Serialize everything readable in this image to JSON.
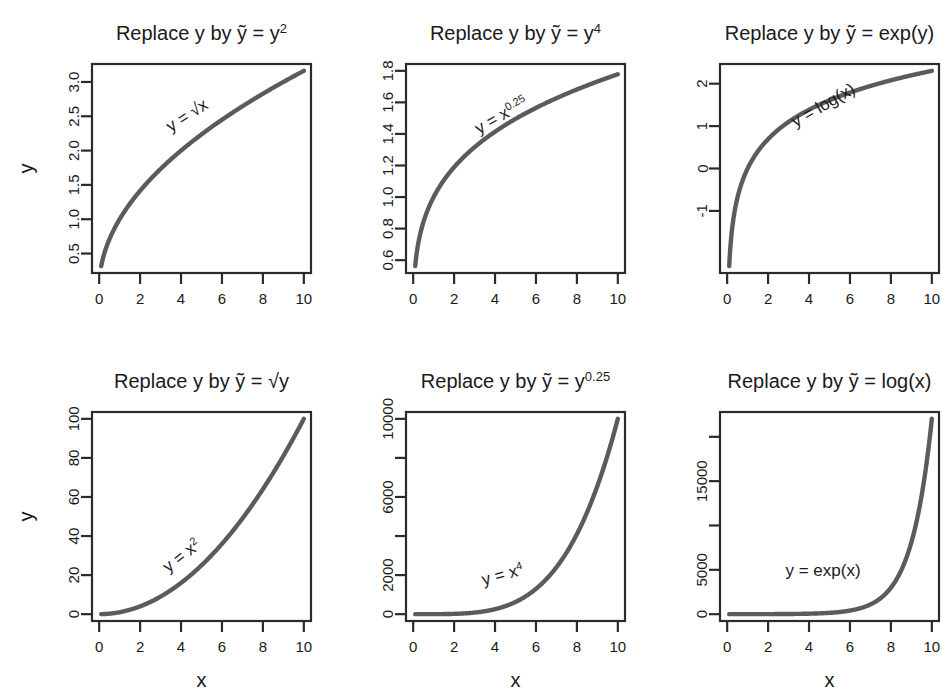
{
  "figure": {
    "width": 942,
    "height": 695,
    "background": "#ffffff",
    "curve_color": "#5b5b5b",
    "axis_color": "#2b2b2b",
    "text_color": "#1a1a1a",
    "layout": "2 rows x 3 columns of R base-graphics panels"
  },
  "chart_data": [
    {
      "id": "panel-1",
      "type": "line",
      "position": "row1-col1",
      "title": "Replace y by ỹ = y2",
      "title_parts": {
        "lead": "Replace y by ",
        "ytilde": "ỹ",
        "eq": " = y",
        "sup": "2"
      },
      "xlabel": "",
      "ylabel": "y",
      "annotation": "y = √x",
      "annotation_rotation_deg": -33,
      "function": "y = sqrt(x)",
      "xlim": [
        0.1,
        10
      ],
      "ylim": [
        0.316,
        3.162
      ],
      "xticks": [
        0,
        2,
        4,
        6,
        8,
        10
      ],
      "xticklabels": [
        "0",
        "2",
        "4",
        "6",
        "8",
        "10"
      ],
      "yticks": [
        0.5,
        1.0,
        1.5,
        2.0,
        2.5,
        3.0
      ],
      "yticklabels": [
        "0.5",
        "1.0",
        "1.5",
        "2.0",
        "2.5",
        "3.0"
      ],
      "grid": false,
      "x": [
        0.1,
        0.5,
        1,
        2,
        3,
        4,
        5,
        6,
        7,
        8,
        9,
        10
      ],
      "y": [
        0.316,
        0.707,
        1.0,
        1.414,
        1.732,
        2.0,
        2.236,
        2.449,
        2.646,
        2.828,
        3.0,
        3.162
      ]
    },
    {
      "id": "panel-2",
      "type": "line",
      "position": "row1-col2",
      "title": "Replace y by ỹ = y4",
      "title_parts": {
        "lead": "Replace y by ",
        "ytilde": "ỹ",
        "eq": " = y",
        "sup": "4"
      },
      "xlabel": "",
      "ylabel": "",
      "annotation": "y = x0.25",
      "annotation_rotation_deg": -30,
      "function": "y = x^0.25",
      "xlim": [
        0.1,
        10
      ],
      "ylim": [
        0.562,
        1.778
      ],
      "xticks": [
        0,
        2,
        4,
        6,
        8,
        10
      ],
      "xticklabels": [
        "0",
        "2",
        "4",
        "6",
        "8",
        "10"
      ],
      "yticks": [
        0.6,
        0.8,
        1.0,
        1.2,
        1.4,
        1.6,
        1.8
      ],
      "yticklabels": [
        "0.6",
        "0.8",
        "1.0",
        "1.2",
        "1.4",
        "1.6",
        "1.8"
      ],
      "grid": false,
      "x": [
        0.1,
        0.5,
        1,
        2,
        3,
        4,
        5,
        6,
        7,
        8,
        9,
        10
      ],
      "y": [
        0.562,
        0.841,
        1.0,
        1.189,
        1.316,
        1.414,
        1.495,
        1.565,
        1.627,
        1.682,
        1.732,
        1.778
      ]
    },
    {
      "id": "panel-3",
      "type": "line",
      "position": "row1-col3",
      "title": "Replace y by ỹ = exp(y)",
      "title_parts": {
        "lead": "Replace y by ",
        "ytilde": "ỹ",
        "eq": " = exp(y)",
        "sup": ""
      },
      "xlabel": "",
      "ylabel": "",
      "annotation": "y = log(x)",
      "annotation_rotation_deg": -30,
      "function": "y = log(x)",
      "xlim": [
        0.1,
        10
      ],
      "ylim": [
        -2.303,
        2.303
      ],
      "xticks": [
        0,
        2,
        4,
        6,
        8,
        10
      ],
      "xticklabels": [
        "0",
        "2",
        "4",
        "6",
        "8",
        "10"
      ],
      "yticks": [
        -1,
        0,
        1,
        2
      ],
      "yticklabels": [
        "-1",
        "0",
        "1",
        "2"
      ],
      "grid": false,
      "x": [
        0.1,
        0.5,
        1,
        2,
        3,
        4,
        5,
        6,
        7,
        8,
        9,
        10
      ],
      "y": [
        -2.303,
        -0.693,
        0.0,
        0.693,
        1.099,
        1.386,
        1.609,
        1.792,
        1.946,
        2.079,
        2.197,
        2.303
      ]
    },
    {
      "id": "panel-4",
      "type": "line",
      "position": "row2-col1",
      "title": "Replace y by ỹ = √y",
      "title_parts": {
        "lead": "Replace y by ",
        "ytilde": "ỹ",
        "eq": " = √y",
        "sup": ""
      },
      "xlabel": "x",
      "ylabel": "y",
      "annotation": "y = x2",
      "annotation_rotation_deg": -38,
      "function": "y = x^2",
      "xlim": [
        0.1,
        10
      ],
      "ylim": [
        0,
        100
      ],
      "xticks": [
        0,
        2,
        4,
        6,
        8,
        10
      ],
      "xticklabels": [
        "0",
        "2",
        "4",
        "6",
        "8",
        "10"
      ],
      "yticks": [
        0,
        20,
        40,
        60,
        80,
        100
      ],
      "yticklabels": [
        "0",
        "20",
        "40",
        "60",
        "80",
        "100"
      ],
      "grid": false,
      "x": [
        0.1,
        1,
        2,
        3,
        4,
        5,
        6,
        7,
        8,
        9,
        10
      ],
      "y": [
        0.01,
        1,
        4,
        9,
        16,
        25,
        36,
        49,
        64,
        81,
        100
      ]
    },
    {
      "id": "panel-5",
      "type": "line",
      "position": "row2-col2",
      "title": "Replace y by ỹ = y0.25",
      "title_parts": {
        "lead": "Replace y by ",
        "ytilde": "ỹ",
        "eq": " = y",
        "sup": "0.25"
      },
      "xlabel": "x",
      "ylabel": "",
      "annotation": "y = x4",
      "annotation_rotation_deg": -15,
      "function": "y = x^4",
      "xlim": [
        0.1,
        10
      ],
      "ylim": [
        0,
        10000
      ],
      "xticks": [
        0,
        2,
        4,
        6,
        8,
        10
      ],
      "xticklabels": [
        "0",
        "2",
        "4",
        "6",
        "8",
        "10"
      ],
      "yticks": [
        0,
        2000,
        4000,
        6000,
        8000,
        10000
      ],
      "yticklabels": [
        "0",
        "2000",
        "",
        "6000",
        "",
        "10000"
      ],
      "grid": false,
      "x": [
        0.1,
        1,
        2,
        3,
        4,
        5,
        6,
        7,
        8,
        9,
        10
      ],
      "y": [
        0.0001,
        1,
        16,
        81,
        256,
        625,
        1296,
        2401,
        4096,
        6561,
        10000
      ]
    },
    {
      "id": "panel-6",
      "type": "line",
      "position": "row2-col3",
      "title": "Replace y by ỹ = log(x)",
      "title_parts": {
        "lead": "Replace y by ",
        "ytilde": "ỹ",
        "eq": " = log(x)",
        "sup": ""
      },
      "xlabel": "x",
      "ylabel": "",
      "annotation": "y = exp(x)",
      "annotation_rotation_deg": 0,
      "function": "y = exp(x)",
      "xlim": [
        0.1,
        10
      ],
      "ylim": [
        0,
        22026
      ],
      "xticks": [
        0,
        2,
        4,
        6,
        8,
        10
      ],
      "xticklabels": [
        "0",
        "2",
        "4",
        "6",
        "8",
        "10"
      ],
      "yticks": [
        0,
        5000,
        10000,
        15000,
        20000
      ],
      "yticklabels": [
        "0",
        "5000",
        "",
        "15000",
        ""
      ],
      "grid": false,
      "x": [
        0.1,
        1,
        2,
        3,
        4,
        5,
        6,
        7,
        8,
        9,
        9.5,
        10
      ],
      "y": [
        1.1,
        2.72,
        7.39,
        20.1,
        54.6,
        148,
        403,
        1097,
        2981,
        8103,
        13360,
        22026
      ]
    }
  ]
}
